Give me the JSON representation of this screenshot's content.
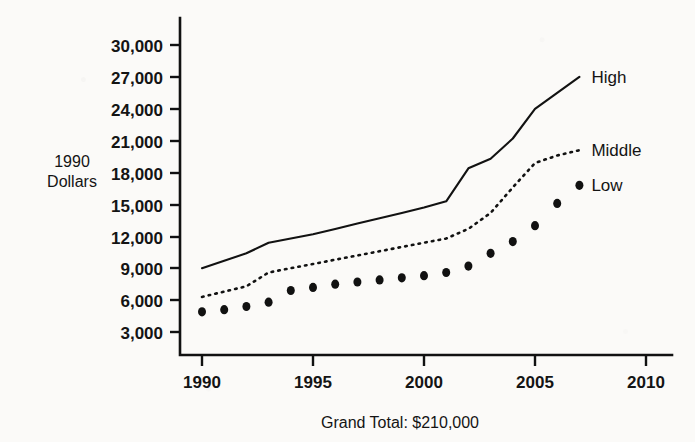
{
  "chart_data": {
    "type": "line",
    "title": "",
    "subtitle": "",
    "caption": "Grand Total: $210,000",
    "xlabel": "",
    "ylabel": "1990 Dollars",
    "ylabel_lines": [
      "1990",
      "Dollars"
    ],
    "xlim": [
      1990,
      2010
    ],
    "ylim": [
      3000,
      30000
    ],
    "grid": false,
    "legend_position": "right-inline",
    "x_ticks": [
      1990,
      1995,
      2000,
      2005,
      2010
    ],
    "x_tick_labels": [
      "1990",
      "1995",
      "2000",
      "2005",
      "2010"
    ],
    "y_ticks": [
      3000,
      6000,
      9000,
      12000,
      15000,
      18000,
      21000,
      24000,
      27000,
      30000
    ],
    "y_tick_labels": [
      "3,000",
      "6,000",
      "9,000",
      "12,000",
      "15,000",
      "18,000",
      "21,000",
      "24,000",
      "27,000",
      "30,000"
    ],
    "x": [
      1990,
      1991,
      1992,
      1993,
      1994,
      1995,
      1996,
      1997,
      1998,
      1999,
      2000,
      2001,
      2002,
      2003,
      2004,
      2005,
      2006,
      2007
    ],
    "series": [
      {
        "name": "High",
        "style": "solid-line",
        "label": "High",
        "values": [
          9000,
          9700,
          10400,
          11400,
          11800,
          12200,
          12700,
          13200,
          13700,
          14200,
          14700,
          15300,
          18400,
          19300,
          21200,
          24000,
          25500,
          27000
        ]
      },
      {
        "name": "Middle",
        "style": "dotted-line",
        "label": "Middle",
        "values": [
          6300,
          6800,
          7300,
          8600,
          9000,
          9400,
          9800,
          10200,
          10600,
          11000,
          11400,
          11800,
          12700,
          14200,
          16600,
          18900,
          19600,
          20100
        ]
      },
      {
        "name": "Low",
        "style": "dot-markers",
        "label": "Low",
        "values": [
          4900,
          5100,
          5400,
          5800,
          6900,
          7200,
          7500,
          7700,
          7900,
          8100,
          8300,
          8600,
          9200,
          10400,
          11500,
          13000,
          15100,
          16800
        ]
      }
    ],
    "colors": {
      "ink": "#121212",
      "background": "#fbfaf8",
      "axis": "#111111"
    }
  }
}
